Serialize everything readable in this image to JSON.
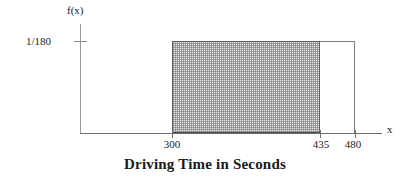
{
  "chart_data": {
    "type": "area",
    "title": "Driving Time in Seconds",
    "xlabel": "x",
    "ylabel": "f(x)",
    "distribution": "uniform",
    "density_value": "1/180",
    "density_label": "1/180",
    "support": [
      300,
      480
    ],
    "shaded_interval": [
      300,
      435
    ],
    "xlim": [
      300,
      480
    ],
    "ylim": [
      0,
      0.005555555555555556
    ],
    "grid": false,
    "legend": false,
    "x_ticks": [
      300,
      435,
      480
    ],
    "x_tick_labels": [
      "300",
      "435",
      "480"
    ],
    "y_ticks": [
      0.005555555555555556
    ],
    "y_tick_labels": [
      "1/180"
    ],
    "series": [
      {
        "name": "Uniform density f(x) = 1/180 on [300, 480]",
        "x": [
          300,
          480
        ],
        "values": [
          0.005555555555555556,
          0.005555555555555556
        ]
      }
    ],
    "shaded_area_probability": 0.75,
    "annotations": []
  },
  "figure": {
    "y_axis_label": "f(x)",
    "x_axis_label": "x",
    "y_tick_label": "1/180",
    "x_tick_labels": {
      "start": "300",
      "shaded_end": "435",
      "support_end": "480"
    },
    "title": "Driving Time in Seconds"
  },
  "colors": {
    "axis": "#6e6e6e",
    "box_border": "#7d7d7d",
    "shade_border": "#5f5f5f",
    "shade_fill": "#e6e6e6",
    "text": "#1a1a1a",
    "background": "#ffffff"
  }
}
